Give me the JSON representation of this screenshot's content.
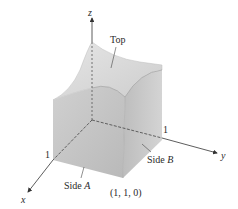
{
  "figure": {
    "axes": {
      "x_label": "x",
      "y_label": "y",
      "z_label": "z"
    },
    "ticks": {
      "x_tick": "1",
      "y_tick": "1"
    },
    "labels": {
      "top": "Top",
      "side_a_prefix": "Side ",
      "side_a_letter": "A",
      "side_b_prefix": "Side ",
      "side_b_letter": "B",
      "corner_point": "(1, 1, 0)"
    },
    "colors": {
      "side_a": "#c4c4c4",
      "side_b": "#b8b8b8",
      "top_surface": "#d8d8d8",
      "inner_back": "#cfcfcf",
      "axis": "#333333"
    }
  }
}
